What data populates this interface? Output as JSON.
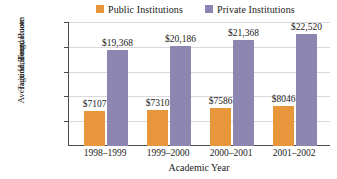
{
  "chart_data": {
    "type": "bar",
    "title": "",
    "xlabel": "Academic Year",
    "ylabel_lines": [
      "Average Undergraduate",
      "Tuition, Fees, Room",
      "and Board"
    ],
    "ylabel": "Average Undergraduate Tuition, Fees, Room and Board",
    "categories": [
      "1998–1999",
      "1999–2000",
      "2000–2001",
      "2001–2002"
    ],
    "series": [
      {
        "name": "Public Institutions",
        "color": "#E8963C",
        "values": [
          7107,
          7310,
          7586,
          8046
        ],
        "value_labels": [
          "$7107",
          "$7310",
          "$7586",
          "$8046"
        ]
      },
      {
        "name": "Private Institutions",
        "color": "#8C86B0",
        "values": [
          19368,
          20186,
          21368,
          22520
        ],
        "value_labels": [
          "$19,368",
          "$20,186",
          "$21,368",
          "$22,520"
        ]
      }
    ],
    "ylim": [
      0,
      25000
    ],
    "yticks": [
      5000,
      10000,
      15000,
      20000,
      25000
    ],
    "ytick_labels": [
      "$5000",
      "$10,000",
      "$15,000",
      "$20,000",
      "$25,000"
    ],
    "grid": true,
    "legend_position": "top"
  },
  "legend": {
    "entries": [
      {
        "label": "Public Institutions",
        "color": "#E8963C"
      },
      {
        "label": "Private Institutions",
        "color": "#8C86B0"
      }
    ]
  }
}
